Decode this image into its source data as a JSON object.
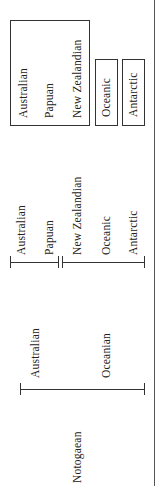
{
  "diagram": {
    "orientation": "rotated-90-ccw",
    "scheme_finest": {
      "grouped_box": [
        "Australian",
        "Papuan",
        "New Zealandian"
      ],
      "separate_boxes": [
        "Oceanic",
        "Antarctic"
      ]
    },
    "scheme_intermediate": {
      "group_a": [
        "Australian",
        "Papuan"
      ],
      "group_b": [
        "New Zealandian",
        "Oceanic",
        "Antarctic"
      ]
    },
    "scheme_broad": {
      "groups": [
        "Australian",
        "Oceanian"
      ]
    },
    "root_label": "Notogaean"
  }
}
